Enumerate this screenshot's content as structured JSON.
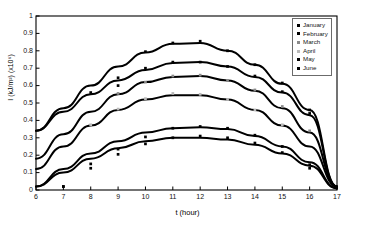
{
  "chart_data": {
    "type": "scatter",
    "title": "",
    "xlabel": "t (hour)",
    "ylabel": "I (kJ/m²) (x10⁶)",
    "xlim": [
      6,
      17
    ],
    "ylim": [
      0,
      1
    ],
    "xticks": [
      6,
      7,
      8,
      9,
      10,
      11,
      12,
      13,
      14,
      15,
      16,
      17
    ],
    "yticks": [
      0,
      0.1,
      0.2,
      0.3,
      0.4,
      0.5,
      0.6,
      0.7,
      0.8,
      0.9,
      1
    ],
    "ytick_labels": [
      "0",
      "0.1",
      "0.2",
      "0.3",
      "0.4",
      "0.5",
      "0.6",
      "0.7",
      "0.8",
      "0.9",
      "1"
    ],
    "xtick_labels": [
      "6",
      "7",
      "8",
      "9",
      "10",
      "11",
      "12",
      "13",
      "14",
      "15",
      "16",
      "17"
    ],
    "grid": false,
    "legend_position": "top-right",
    "fit_type": "parabola",
    "series": [
      {
        "name": "January",
        "marker": "square",
        "color": "#000000",
        "peak_x": 11.8,
        "peak_y": 0.845,
        "x": [
          6,
          7,
          8,
          9,
          10,
          11,
          12,
          13,
          14,
          15,
          16,
          17
        ],
        "y": [
          0.34,
          0.47,
          0.6,
          0.71,
          0.79,
          0.84,
          0.845,
          0.8,
          0.72,
          0.61,
          0.46,
          0.02
        ],
        "points_x": [
          9,
          10,
          11,
          12,
          13,
          14,
          15,
          16
        ],
        "points_y": [
          0.6,
          0.795,
          0.845,
          0.855,
          0.8,
          0.72,
          0.615,
          0.46
        ]
      },
      {
        "name": "February",
        "marker": "square",
        "color": "#000000",
        "peak_x": 11.7,
        "peak_y": 0.735,
        "x": [
          6,
          7,
          8,
          9,
          10,
          11,
          12,
          13,
          14,
          15,
          16,
          17
        ],
        "y": [
          0.34,
          0.45,
          0.55,
          0.63,
          0.69,
          0.73,
          0.735,
          0.71,
          0.65,
          0.56,
          0.43,
          0.02
        ],
        "points_x": [
          8,
          9,
          10,
          11,
          12,
          13,
          14,
          15,
          16
        ],
        "points_y": [
          0.56,
          0.645,
          0.7,
          0.735,
          0.735,
          0.71,
          0.655,
          0.565,
          0.44
        ]
      },
      {
        "name": "March",
        "marker": "square",
        "color": "#8a8a8a",
        "peak_x": 11.9,
        "peak_y": 0.655,
        "x": [
          6,
          7,
          8,
          9,
          10,
          11,
          12,
          13,
          14,
          15,
          16,
          17
        ],
        "y": [
          0.18,
          0.32,
          0.45,
          0.55,
          0.62,
          0.65,
          0.655,
          0.63,
          0.57,
          0.47,
          0.33,
          0.02
        ],
        "points_x": [
          9,
          10,
          11,
          12,
          13,
          14,
          15,
          16
        ],
        "points_y": [
          0.555,
          0.62,
          0.655,
          0.66,
          0.63,
          0.575,
          0.48,
          0.34
        ]
      },
      {
        "name": "April",
        "marker": "square",
        "color": "#b9b9b9",
        "peak_x": 11.8,
        "peak_y": 0.545,
        "x": [
          6,
          7,
          8,
          9,
          10,
          11,
          12,
          13,
          14,
          15,
          16,
          17
        ],
        "y": [
          0.12,
          0.25,
          0.37,
          0.46,
          0.52,
          0.545,
          0.545,
          0.52,
          0.46,
          0.37,
          0.25,
          0.02
        ],
        "points_x": [
          8,
          9,
          10,
          11,
          12,
          13,
          14,
          15
        ],
        "points_y": [
          0.375,
          0.465,
          0.525,
          0.555,
          0.55,
          0.52,
          0.46,
          0.375
        ]
      },
      {
        "name": "May",
        "marker": "square",
        "color": "#000000",
        "peak_x": 11.9,
        "peak_y": 0.36,
        "x": [
          6,
          7,
          8,
          9,
          10,
          11,
          12,
          13,
          14,
          15,
          16,
          17
        ],
        "y": [
          0.02,
          0.12,
          0.21,
          0.28,
          0.33,
          0.355,
          0.36,
          0.35,
          0.31,
          0.25,
          0.16,
          0.01
        ],
        "points_x": [
          7,
          8,
          9,
          10,
          11,
          12,
          13,
          14,
          15,
          16
        ],
        "points_y": [
          0.02,
          0.15,
          0.235,
          0.305,
          0.355,
          0.365,
          0.355,
          0.315,
          0.25,
          0.145
        ]
      },
      {
        "name": "June",
        "marker": "square",
        "color": "#000000",
        "peak_x": 11.8,
        "peak_y": 0.3,
        "x": [
          6,
          7,
          8,
          9,
          10,
          11,
          12,
          13,
          14,
          15,
          16,
          17
        ],
        "y": [
          0.02,
          0.1,
          0.18,
          0.24,
          0.28,
          0.3,
          0.3,
          0.29,
          0.26,
          0.21,
          0.14,
          0.01
        ],
        "points_x": [
          7,
          8,
          9,
          10,
          11,
          12,
          13,
          14,
          15,
          16
        ],
        "points_y": [
          0.02,
          0.125,
          0.205,
          0.265,
          0.3,
          0.31,
          0.3,
          0.27,
          0.215,
          0.125
        ]
      }
    ]
  },
  "legend": {
    "items": [
      {
        "label": "January"
      },
      {
        "label": "February"
      },
      {
        "label": "March"
      },
      {
        "label": "April"
      },
      {
        "label": "May"
      },
      {
        "label": "June"
      }
    ]
  }
}
